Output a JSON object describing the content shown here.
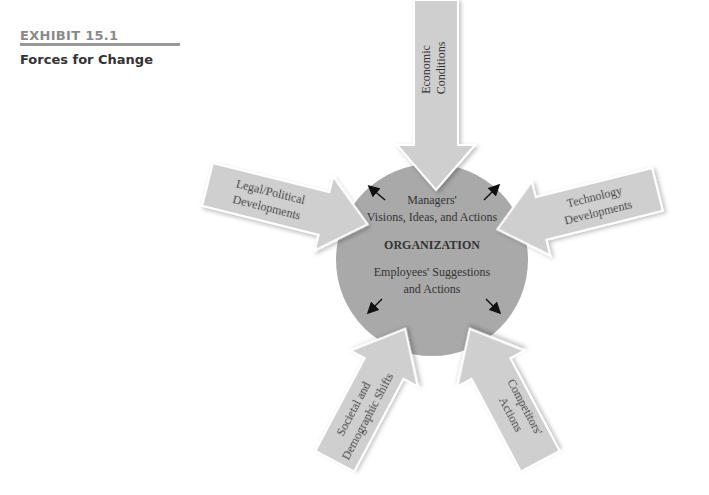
{
  "exhibit": {
    "number_label": "EXHIBIT 15.1",
    "title": "Forces for Change"
  },
  "center": {
    "line1": "Managers'",
    "line2": "Visions, Ideas, and Actions",
    "org_label": "ORGANIZATION",
    "line3": "Employees' Suggestions",
    "line4": "and Actions"
  },
  "forces": {
    "top": {
      "line1": "Economic",
      "line2": "Conditions"
    },
    "left": {
      "line1": "Legal/Political",
      "line2": "Developments"
    },
    "right": {
      "line1": "Technology",
      "line2": "Developments"
    },
    "bottom_left": {
      "line1": "Societal and",
      "line2": "Demographic Shifts"
    },
    "bottom_right": {
      "line1": "Competitors'",
      "line2": "Actions"
    }
  },
  "colors": {
    "circle": "#a9a9a9",
    "arrow_fill": "#cfcfcf",
    "arrow_stroke": "#ffffff",
    "rule": "#9a9a9a",
    "exhibit_label": "#8a8a8a"
  }
}
